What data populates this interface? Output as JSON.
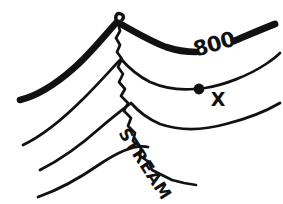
{
  "figure": {
    "kind": "topographic-contour-sketch",
    "width": 283,
    "height": 204,
    "background_color": "#ffffff",
    "ink_color": "#111111"
  },
  "labels": {
    "elevation": "800",
    "point_marker": "X",
    "stream": "STREAM"
  },
  "diagram_data": {
    "type": "diagram",
    "description": "Hand-drawn topographic map sketch: four V-shaped contour lines bending upstream across a stream valley, with the 800 ft contour labeled and a point X marked on the next lower contour.",
    "contours": [
      {
        "id": "contour-800",
        "elevation_label": "800",
        "weight": "index-thick",
        "stroke_width": 6.5,
        "label_gap": true,
        "apex": [
          118,
          22
        ]
      },
      {
        "id": "contour-2",
        "elevation_label": "",
        "weight": "intermediate-thin",
        "stroke_width": 2.6,
        "label_gap": false,
        "apex": [
          122,
          60
        ]
      },
      {
        "id": "contour-3",
        "elevation_label": "",
        "weight": "intermediate-thin",
        "stroke_width": 2.6,
        "label_gap": false,
        "apex": [
          131,
          104
        ]
      },
      {
        "id": "contour-4",
        "elevation_label": "",
        "weight": "intermediate-thin",
        "stroke_width": 2.6,
        "label_gap": false,
        "apex": [
          148,
          148
        ]
      }
    ],
    "stream": {
      "id": "stream-line",
      "label": "STREAM",
      "stroke_width": 2.6,
      "flow_direction": "down-valley toward lower right",
      "start": [
        118,
        22
      ],
      "end": [
        196,
        185
      ]
    },
    "point": {
      "id": "point-x",
      "label": "X",
      "center": [
        199,
        89
      ],
      "radius": 5,
      "on_contour": "contour-2",
      "filled": true
    },
    "annotations": [
      {
        "text": "800",
        "x": 216,
        "y": 51,
        "rotation": -16
      },
      {
        "text": "X",
        "x": 218,
        "y": 106,
        "rotation": 0
      },
      {
        "text": "STREAM",
        "x": 118,
        "y": 133,
        "rotation": 57
      }
    ]
  }
}
